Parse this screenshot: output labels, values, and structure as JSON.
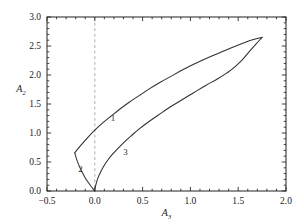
{
  "chart_data": {
    "type": "line",
    "title": "",
    "xlabel": "A_3",
    "ylabel": "A_2",
    "xlabel_base": "A",
    "xlabel_sub": "3",
    "ylabel_base": "A",
    "ylabel_sub": "2",
    "xlim": [
      -0.5,
      2.0
    ],
    "ylim": [
      0.0,
      3.0
    ],
    "xticks": [
      -0.5,
      0.0,
      0.5,
      1.0,
      1.5,
      2.0
    ],
    "xtick_labels": [
      "-0.5",
      "0.0",
      "0.5",
      "1.0",
      "1.5",
      "2.0"
    ],
    "yticks": [
      0.0,
      0.5,
      1.0,
      1.5,
      2.0,
      2.5,
      3.0
    ],
    "ytick_labels": [
      "0.0",
      "0.5",
      "1.0",
      "1.5",
      "2.0",
      "2.5",
      "3.0"
    ],
    "minor_ticks_per_interval": 5,
    "grid": false,
    "legend": "none",
    "frame": true,
    "reference_lines": [
      {
        "name": "zero-vertical",
        "orientation": "vertical",
        "value": 0.0,
        "style": "dashed",
        "color": "#9a9a9a"
      }
    ],
    "annotations": [
      {
        "label": "1",
        "x": 0.19,
        "y": 1.21
      },
      {
        "label": "2",
        "x": -0.15,
        "y": 0.33
      },
      {
        "label": "3",
        "x": 0.32,
        "y": 0.62
      }
    ],
    "series": [
      {
        "name": "1",
        "color": "#303030",
        "style": "solid",
        "points": [
          [
            -0.21,
            0.66
          ],
          [
            -0.14,
            0.8
          ],
          [
            -0.07,
            0.93
          ],
          [
            0.0,
            1.05
          ],
          [
            0.08,
            1.17
          ],
          [
            0.17,
            1.29
          ],
          [
            0.26,
            1.41
          ],
          [
            0.36,
            1.53
          ],
          [
            0.46,
            1.64
          ],
          [
            0.57,
            1.76
          ],
          [
            0.68,
            1.87
          ],
          [
            0.8,
            1.98
          ],
          [
            0.92,
            2.09
          ],
          [
            1.04,
            2.19
          ],
          [
            1.17,
            2.29
          ],
          [
            1.3,
            2.38
          ],
          [
            1.43,
            2.47
          ],
          [
            1.57,
            2.56
          ],
          [
            1.66,
            2.61
          ],
          [
            1.75,
            2.65
          ]
        ]
      },
      {
        "name": "2",
        "color": "#303030",
        "style": "solid",
        "points": [
          [
            -0.21,
            0.66
          ],
          [
            -0.195,
            0.57
          ],
          [
            -0.175,
            0.48
          ],
          [
            -0.152,
            0.39
          ],
          [
            -0.125,
            0.3
          ],
          [
            -0.098,
            0.22
          ],
          [
            -0.07,
            0.15
          ],
          [
            -0.044,
            0.09
          ],
          [
            -0.022,
            0.045
          ],
          [
            -0.008,
            0.015
          ],
          [
            0.0,
            0.0
          ]
        ]
      },
      {
        "name": "3",
        "color": "#303030",
        "style": "solid",
        "points": [
          [
            0.0,
            0.0
          ],
          [
            0.006,
            0.07
          ],
          [
            0.018,
            0.15
          ],
          [
            0.036,
            0.24
          ],
          [
            0.062,
            0.33
          ],
          [
            0.095,
            0.43
          ],
          [
            0.135,
            0.53
          ],
          [
            0.183,
            0.63
          ],
          [
            0.24,
            0.73
          ],
          [
            0.305,
            0.84
          ],
          [
            0.38,
            0.95
          ],
          [
            0.465,
            1.07
          ],
          [
            0.56,
            1.19
          ],
          [
            0.665,
            1.31
          ],
          [
            0.78,
            1.44
          ],
          [
            0.9,
            1.56
          ],
          [
            1.03,
            1.69
          ],
          [
            1.16,
            1.82
          ],
          [
            1.29,
            1.94
          ],
          [
            1.42,
            2.08
          ],
          [
            1.53,
            2.24
          ],
          [
            1.62,
            2.41
          ],
          [
            1.69,
            2.54
          ],
          [
            1.75,
            2.65
          ]
        ]
      }
    ]
  },
  "plot_area": {
    "left": 47,
    "top": 17,
    "right": 286,
    "bottom": 191
  }
}
